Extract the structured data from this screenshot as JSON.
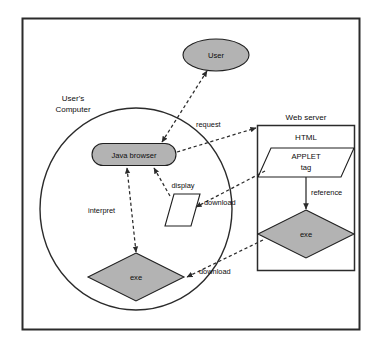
{
  "diagram": {
    "colors": {
      "shape_fill_gray": "#b3b3b3",
      "shape_fill_white": "#ffffff",
      "stroke": "#2b2b2b",
      "background": "#ffffff"
    },
    "groups": [
      {
        "id": "users-computer",
        "label": "User's\nComputer",
        "label_line1": "User's",
        "label_line2": "Computer",
        "shape": "circle"
      },
      {
        "id": "web-server",
        "label": "Web server",
        "shape": "rectangle"
      }
    ],
    "nodes": [
      {
        "id": "user",
        "label": "User",
        "shape": "ellipse",
        "fill": "gray"
      },
      {
        "id": "java-browser",
        "label": "Java browser",
        "shape": "rounded-rectangle",
        "fill": "gray"
      },
      {
        "id": "display",
        "label": "display",
        "shape": "parallelogram",
        "fill": "white"
      },
      {
        "id": "client-exe",
        "label": "exe",
        "shape": "diamond",
        "fill": "gray"
      },
      {
        "id": "applet-tag",
        "label_line1": "APPLET",
        "label_line2": "tag",
        "label": "APPLET tag",
        "shape": "parallelogram",
        "fill": "white"
      },
      {
        "id": "html",
        "label": "HTML",
        "shape": "label-only"
      },
      {
        "id": "server-exe",
        "label": "exe",
        "shape": "diamond",
        "fill": "gray"
      }
    ],
    "edges": [
      {
        "id": "browser-to-user",
        "label": "",
        "style": "dashed",
        "from": "java-browser",
        "to": "user"
      },
      {
        "id": "browser-to-server",
        "label": "request",
        "style": "dashed",
        "from": "java-browser",
        "to": "web-server"
      },
      {
        "id": "applet-to-display",
        "label": "download",
        "style": "dashed",
        "from": "applet-tag",
        "to": "display"
      },
      {
        "id": "server-exe-to-client-exe",
        "label": "download",
        "style": "dashed",
        "from": "server-exe",
        "to": "client-exe"
      },
      {
        "id": "client-exe-to-browser",
        "label": "interpret",
        "style": "dashed",
        "from": "client-exe",
        "to": "java-browser"
      },
      {
        "id": "display-to-browser",
        "label": "",
        "style": "dashed",
        "from": "display",
        "to": "java-browser"
      },
      {
        "id": "applet-tag-to-server-exe",
        "label": "reference",
        "style": "solid",
        "from": "applet-tag",
        "to": "server-exe"
      }
    ]
  }
}
